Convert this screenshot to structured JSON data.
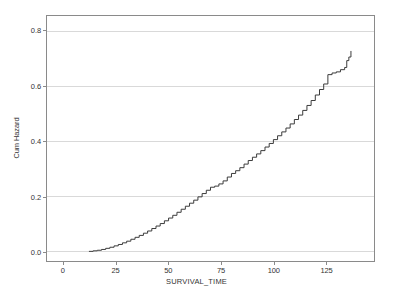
{
  "chart_data": {
    "type": "line",
    "title": "",
    "subtitle": "",
    "xlabel": "SURVIVAL_TIME",
    "ylabel": "Cum Hazard",
    "xlim": [
      -8,
      148
    ],
    "ylim": [
      -0.035,
      0.855
    ],
    "xticks": [
      0,
      25,
      50,
      75,
      100,
      125
    ],
    "xtick_labels": [
      "0",
      "25",
      "50",
      "75",
      "100",
      "125"
    ],
    "yticks": [
      0.0,
      0.2,
      0.4,
      0.6,
      0.8
    ],
    "ytick_labels": [
      "0.0",
      "0.2",
      "0.4",
      "0.6",
      "0.8"
    ],
    "grid": "horizontal",
    "legend": "none",
    "line_color": "#3a3a3a",
    "gridline_color": "#d9d9d9",
    "axis_color": "#8a8a8a",
    "series": [
      {
        "name": "Cum Hazard",
        "x": [
          12,
          14,
          16,
          18,
          20,
          22,
          24,
          26,
          28,
          30,
          32,
          34,
          36,
          38,
          40,
          42,
          44,
          46,
          48,
          50,
          52,
          54,
          56,
          58,
          60,
          62,
          64,
          66,
          68,
          70,
          72,
          74,
          76,
          78,
          80,
          82,
          84,
          86,
          88,
          90,
          92,
          94,
          96,
          98,
          100,
          102,
          104,
          106,
          108,
          110,
          112,
          114,
          116,
          118,
          120,
          122,
          124,
          126,
          128,
          130,
          132,
          134,
          135,
          136,
          137
        ],
        "y": [
          0.0,
          0.002,
          0.004,
          0.007,
          0.011,
          0.015,
          0.02,
          0.025,
          0.031,
          0.037,
          0.044,
          0.051,
          0.058,
          0.066,
          0.074,
          0.083,
          0.092,
          0.101,
          0.111,
          0.121,
          0.131,
          0.142,
          0.153,
          0.164,
          0.175,
          0.186,
          0.198,
          0.21,
          0.222,
          0.233,
          0.237,
          0.245,
          0.256,
          0.27,
          0.283,
          0.293,
          0.304,
          0.317,
          0.33,
          0.342,
          0.354,
          0.366,
          0.379,
          0.392,
          0.406,
          0.42,
          0.434,
          0.448,
          0.463,
          0.479,
          0.495,
          0.512,
          0.53,
          0.548,
          0.568,
          0.588,
          0.608,
          0.642,
          0.648,
          0.652,
          0.66,
          0.668,
          0.693,
          0.706,
          0.728
        ]
      }
    ]
  }
}
